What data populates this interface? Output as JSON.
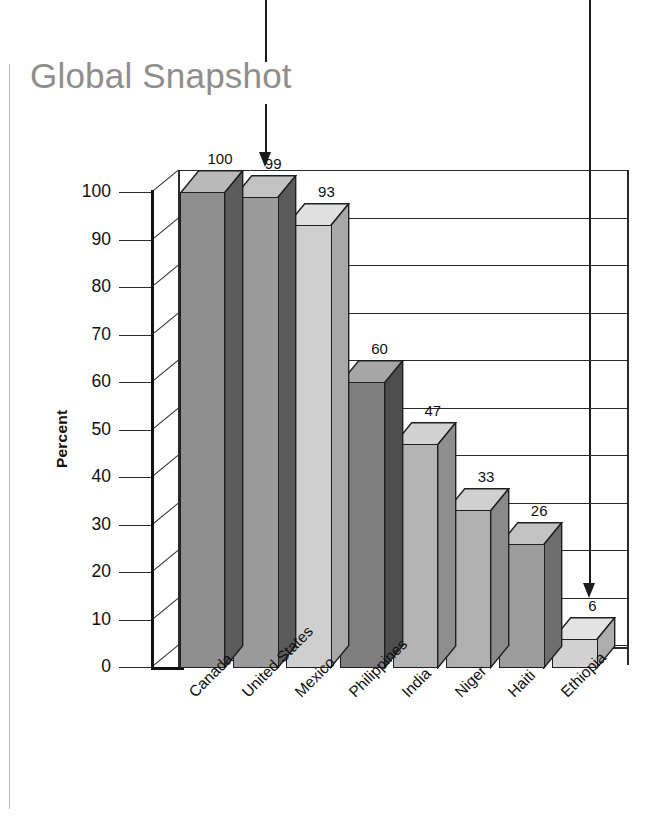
{
  "page": {
    "title": "Global Snapshot"
  },
  "annotations": {
    "arrow_left_name": "callout-arrow-united-states",
    "arrow_right_name": "callout-arrow-ethiopia"
  },
  "chart_data": {
    "type": "bar",
    "title": "Global Snapshot",
    "xlabel": "",
    "ylabel": "Percent",
    "ylim": [
      0,
      100
    ],
    "yticks": [
      0,
      10,
      20,
      30,
      40,
      50,
      60,
      70,
      80,
      90,
      100
    ],
    "grid": true,
    "legend": "none",
    "style": "3d-column",
    "categories": [
      "Canada",
      "United States",
      "Mexico",
      "Philippines",
      "India",
      "Niger",
      "Haiti",
      "Ethiopia"
    ],
    "values": [
      100,
      99,
      93,
      60,
      47,
      33,
      26,
      6
    ],
    "value_labels": [
      "100",
      "99",
      "93",
      "60",
      "47",
      "33",
      "26",
      "6"
    ],
    "bar_colors": [
      "#8e8e8e",
      "#9a9a9a",
      "#cfcfcf",
      "#7e7e7e",
      "#b4b4b4",
      "#b0b0b0",
      "#9c9c9c",
      "#d2d2d2"
    ],
    "bar_side_colors": [
      "#5c5c5c",
      "#5a5a5a",
      "#a8a8a8",
      "#4e4e4e",
      "#8e8e8e",
      "#8a8a8a",
      "#6e6e6e",
      "#adadad"
    ],
    "bar_top_colors": [
      "#b9b9b9",
      "#c2c2c2",
      "#e0e0e0",
      "#a6a6a6",
      "#d2d2d2",
      "#d0d0d0",
      "#c2c2c2",
      "#e3e3e3"
    ]
  }
}
